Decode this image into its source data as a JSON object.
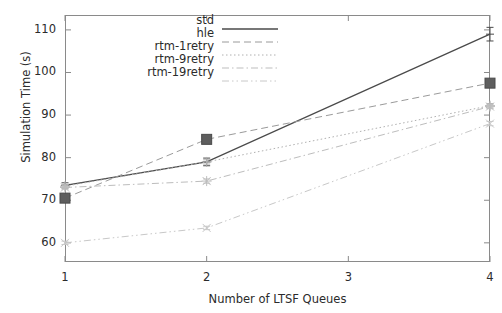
{
  "chart_data": {
    "type": "line",
    "title": "",
    "xlabel": "Number of LTSF Queues",
    "ylabel": "Simulation Time (s)",
    "x": [
      1,
      2,
      3,
      4
    ],
    "xticks": [
      "1",
      "2",
      "3",
      "4"
    ],
    "yticks": [
      "60",
      "70",
      "80",
      "90",
      "100",
      "110"
    ],
    "xlim": [
      1,
      4
    ],
    "ylim": [
      55.5,
      113.5
    ],
    "grid": false,
    "legend_position": "top-center",
    "series": [
      {
        "name": "std",
        "color": "#4a4a4a",
        "style": "solid",
        "marker": "errorbar",
        "x": [
          1,
          2,
          4
        ],
        "values": [
          73.5,
          79.0,
          109.0
        ],
        "errors": [
          0.6,
          0.9,
          1.6
        ]
      },
      {
        "name": "hle",
        "color": "#9a9a9a",
        "style": "dashed",
        "marker": "square",
        "x": [
          1,
          2,
          4
        ],
        "values": [
          70.5,
          84.3,
          97.5
        ],
        "errors": [
          0.5,
          0.5,
          0.6
        ]
      },
      {
        "name": "rtm-1retry",
        "color": "#b0b0b0",
        "style": "dotted",
        "marker": "plus",
        "x": [
          1,
          2,
          4
        ],
        "values": [
          73.3,
          79.0,
          92.2
        ],
        "errors": [
          0.4,
          0.5,
          0.5
        ]
      },
      {
        "name": "rtm-9retry",
        "color": "#bdbdbd",
        "style": "dashdot",
        "marker": "star",
        "x": [
          1,
          2,
          4
        ],
        "values": [
          73.0,
          74.5,
          92.0
        ],
        "errors": [
          0.4,
          0.5,
          0.5
        ]
      },
      {
        "name": "rtm-19retry",
        "color": "#c8c8c8",
        "style": "dashdotdot",
        "marker": "x",
        "x": [
          1,
          2,
          4
        ],
        "values": [
          60.0,
          63.5,
          88.0
        ],
        "errors": [
          0.4,
          0.4,
          0.5
        ]
      }
    ]
  },
  "axes": {
    "ylabel": "Simulation Time (s)",
    "xlabel": "Number of LTSF Queues",
    "ytick_labels": [
      "110",
      "100",
      "90",
      "80",
      "70",
      "60"
    ],
    "xtick_labels": [
      "1",
      "2",
      "3",
      "4"
    ]
  },
  "legend": {
    "entries": [
      {
        "label": "std"
      },
      {
        "label": "hle"
      },
      {
        "label": "rtm-1retry"
      },
      {
        "label": "rtm-9retry"
      },
      {
        "label": "rtm-19retry"
      }
    ]
  }
}
